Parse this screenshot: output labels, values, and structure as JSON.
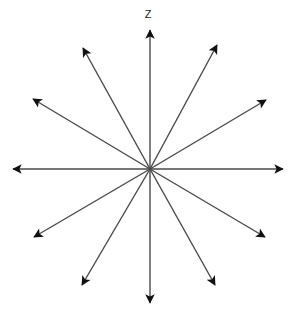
{
  "figure": {
    "title": "",
    "axis_label": "Z",
    "background_color": "#ffffff",
    "line_color": "#4a4a4a",
    "arrowhead_color": "#111111",
    "label_color": "#1c1c1c",
    "line_width": 1.4,
    "center": {
      "x": 150,
      "y": 169
    },
    "ray_count": 12,
    "angle_step_degrees": 30
  },
  "chart_data": {
    "type": "scatter",
    "title": "",
    "subtitle": "",
    "xlabel": "",
    "ylabel": "Z",
    "legend": [],
    "grid": false,
    "xlim": [
      0,
      296
    ],
    "ylim": [
      0,
      319
    ],
    "center": {
      "x": 150,
      "y": 169
    },
    "rays": [
      {
        "name": "ray-up-z-axis",
        "angle_degrees": 90,
        "length": 139,
        "tip": {
          "x": 150,
          "y": 30
        },
        "label": "Z"
      },
      {
        "name": "ray-up-right-steep",
        "angle_degrees": 60,
        "length": 138,
        "tip": {
          "x": 217,
          "y": 45
        },
        "label": ""
      },
      {
        "name": "ray-up-right-shallow",
        "angle_degrees": 30,
        "length": 133,
        "tip": {
          "x": 266,
          "y": 100
        },
        "label": ""
      },
      {
        "name": "ray-right",
        "angle_degrees": 0,
        "length": 133,
        "tip": {
          "x": 283,
          "y": 169
        },
        "label": ""
      },
      {
        "name": "ray-down-right-shallow",
        "angle_degrees": -30,
        "length": 133,
        "tip": {
          "x": 265,
          "y": 237
        },
        "label": ""
      },
      {
        "name": "ray-down-right-steep",
        "angle_degrees": -60,
        "length": 134,
        "tip": {
          "x": 215,
          "y": 285
        },
        "label": ""
      },
      {
        "name": "ray-down",
        "angle_degrees": -90,
        "length": 134,
        "tip": {
          "x": 150,
          "y": 303
        },
        "label": ""
      },
      {
        "name": "ray-down-left-steep",
        "angle_degrees": -120,
        "length": 134,
        "tip": {
          "x": 82,
          "y": 285
        },
        "label": ""
      },
      {
        "name": "ray-down-left-shallow",
        "angle_degrees": -150,
        "length": 134,
        "tip": {
          "x": 34,
          "y": 237
        },
        "label": ""
      },
      {
        "name": "ray-left",
        "angle_degrees": 180,
        "length": 137,
        "tip": {
          "x": 13,
          "y": 169
        },
        "label": ""
      },
      {
        "name": "ray-up-left-shallow",
        "angle_degrees": 150,
        "length": 135,
        "tip": {
          "x": 33,
          "y": 99
        },
        "label": ""
      },
      {
        "name": "ray-up-left-steep",
        "angle_degrees": 120,
        "length": 135,
        "tip": {
          "x": 83,
          "y": 48
        },
        "label": ""
      }
    ]
  }
}
